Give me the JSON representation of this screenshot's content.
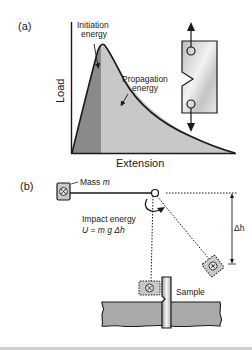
{
  "panel_a": {
    "label": "(a)",
    "y_axis_label": "Load",
    "x_axis_label": "Extension",
    "initiation_label_line1": "Initiation",
    "initiation_label_line2": "energy",
    "propagation_label_line1": "Propagation",
    "propagation_label_line2": "energy",
    "colors": {
      "initiation_fill": "#8a8a8a",
      "propagation_fill": "#c8c8c8",
      "curve": "#1a1a1a",
      "specimen_fill": "#d6d6d6"
    }
  },
  "panel_b": {
    "label": "(b)",
    "mass_label_prefix": "Mass ",
    "mass_symbol": "m",
    "impact_label": "Impact energy",
    "formula_lhs": "U",
    "formula_eq": " = ",
    "formula_rhs": "m g Δh",
    "delta_h_label": "Δh",
    "sample_label": "Sample",
    "colors": {
      "mass_fill": "#c9c9c9",
      "ground_fill": "#a9a9a9",
      "sample_fill": "#e6e6e6"
    }
  }
}
